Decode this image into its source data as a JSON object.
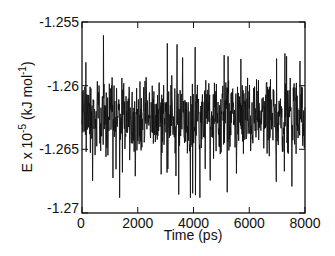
{
  "chart_data": {
    "type": "line",
    "title": "",
    "xlabel": "Time (ps)",
    "ylabel_main": "E x 10",
    "ylabel_exp": "-5",
    "ylabel_unit": " (kJ mol",
    "ylabel_unit_exp": "-1",
    "ylabel_close": ")",
    "xlim": [
      0,
      8000
    ],
    "ylim": [
      -1.27,
      -1.255
    ],
    "xticks": [
      0,
      2000,
      4000,
      6000,
      8000
    ],
    "xtick_labels": [
      "0",
      "2000",
      "4000",
      "6000",
      "8000"
    ],
    "yticks": [
      -1.27,
      -1.265,
      -1.26,
      -1.255
    ],
    "ytick_labels": [
      "-1.27",
      "-1.265",
      "-1.26",
      "-1.255"
    ],
    "grid": false,
    "legend": null,
    "series": [
      {
        "name": "E",
        "color": "#111111",
        "description": "Noisy energy fluctuation around mean -1.2625 over 0-8000 ps; typical range -1.2595 to -1.2665, occasional spikes to ~-1.2552 and ~-1.2685",
        "mean": -1.2625,
        "n_points": 800,
        "sample_points": {
          "x": [
            0,
            250,
            500,
            750,
            1000,
            1250,
            1500,
            1750,
            2000,
            2250,
            2500,
            2750,
            3000,
            3250,
            3500,
            3750,
            4000,
            4250,
            4500,
            4750,
            5000,
            5250,
            5500,
            5750,
            6000,
            6250,
            6500,
            6750,
            7000,
            7250,
            7500,
            7750,
            8000
          ],
          "y": [
            -1.2615,
            -1.2665,
            -1.26,
            -1.268,
            -1.259,
            -1.265,
            -1.2605,
            -1.264,
            -1.2555,
            -1.266,
            -1.261,
            -1.267,
            -1.26,
            -1.2645,
            -1.262,
            -1.266,
            -1.2585,
            -1.2665,
            -1.256,
            -1.265,
            -1.26,
            -1.267,
            -1.261,
            -1.264,
            -1.2595,
            -1.266,
            -1.2558,
            -1.2645,
            -1.2615,
            -1.268,
            -1.257,
            -1.265,
            -1.262
          ]
        }
      }
    ]
  }
}
